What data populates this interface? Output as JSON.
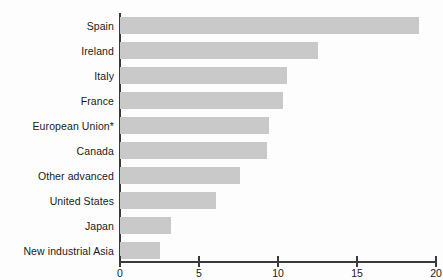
{
  "chart_data": {
    "type": "bar",
    "orientation": "horizontal",
    "title": "",
    "subtitle": "",
    "xlabel": "",
    "ylabel": "",
    "xlim": [
      0,
      20
    ],
    "ylim": null,
    "grid": false,
    "legend": null,
    "bar_color": "#c9c9c9",
    "axis_color": "#3a3a3a",
    "background": "#fdfdfd",
    "xticks": [
      0,
      5,
      10,
      15,
      20
    ],
    "xtick_labels": [
      "0",
      "5",
      "10",
      "15",
      "20"
    ],
    "categories": [
      "Spain",
      "Ireland",
      "Italy",
      "France",
      "European Union*",
      "Canada",
      "Other advanced",
      "United States",
      "Japan",
      "New industrial Asia"
    ],
    "values": [
      18.9,
      12.5,
      10.6,
      10.3,
      9.4,
      9.3,
      7.6,
      6.1,
      3.2,
      2.5
    ],
    "annotations": [
      "*"
    ]
  }
}
